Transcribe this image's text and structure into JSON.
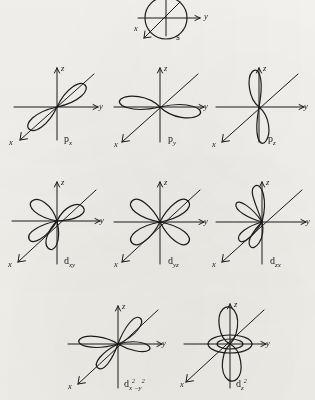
{
  "figure": {
    "background_color": "#f4f2ee",
    "ink_color": "#1b1b1b"
  },
  "axes": {
    "z_label": "z",
    "y_label": "y",
    "x_label": "x"
  },
  "orbitals": [
    {
      "id": "s",
      "row": 1,
      "label_main": "s",
      "label_sub": "",
      "label_sup": "",
      "shape": "sphere",
      "lobes": 1,
      "description": "spherical s orbital drawn as a circle centred on the origin"
    },
    {
      "id": "px",
      "row": 2,
      "label_main": "p",
      "label_sub": "x",
      "label_sup": "",
      "shape": "dumbbell-diagonal",
      "lobes": 2,
      "description": "two lobes aligned along the x axis, drawn diagonally lower-left to upper-right"
    },
    {
      "id": "py",
      "row": 2,
      "label_main": "p",
      "label_sub": "y",
      "label_sup": "",
      "shape": "dumbbell-horizontal",
      "lobes": 2,
      "description": "two lobes aligned horizontally along the y axis"
    },
    {
      "id": "pz",
      "row": 2,
      "label_main": "p",
      "label_sub": "z",
      "label_sup": "",
      "shape": "dumbbell-vertical",
      "lobes": 2,
      "description": "two lobes aligned vertically along the z axis"
    },
    {
      "id": "dxy",
      "row": 3,
      "label_main": "d",
      "label_sub": "xy",
      "label_sup": "",
      "shape": "cloverleaf",
      "lobes": 4,
      "description": "four lobes between the x and y axes"
    },
    {
      "id": "dyz",
      "row": 3,
      "label_main": "d",
      "label_sub": "yz",
      "label_sup": "",
      "shape": "cloverleaf",
      "lobes": 4,
      "description": "four lobes between the y and z axes"
    },
    {
      "id": "dzx",
      "row": 3,
      "label_main": "d",
      "label_sub": "zx",
      "label_sup": "",
      "shape": "cloverleaf",
      "lobes": 4,
      "description": "four lobes between the z and x axes"
    },
    {
      "id": "dx2y2",
      "row": 4,
      "label_main": "d",
      "label_sub": "x",
      "label_sup": "2",
      "label_sub2": "–y",
      "label_sup2": "2",
      "shape": "cloverleaf-on-axes",
      "lobes": 4,
      "description": "four lobes lying along the x and y axes"
    },
    {
      "id": "dz2",
      "row": 4,
      "label_main": "d",
      "label_sub": "z",
      "label_sup": "2",
      "shape": "dumbbell-with-torus",
      "lobes": 2,
      "has_torus": true,
      "description": "two lobes along the z axis with a doughnut shaped ring in the xy plane"
    }
  ]
}
